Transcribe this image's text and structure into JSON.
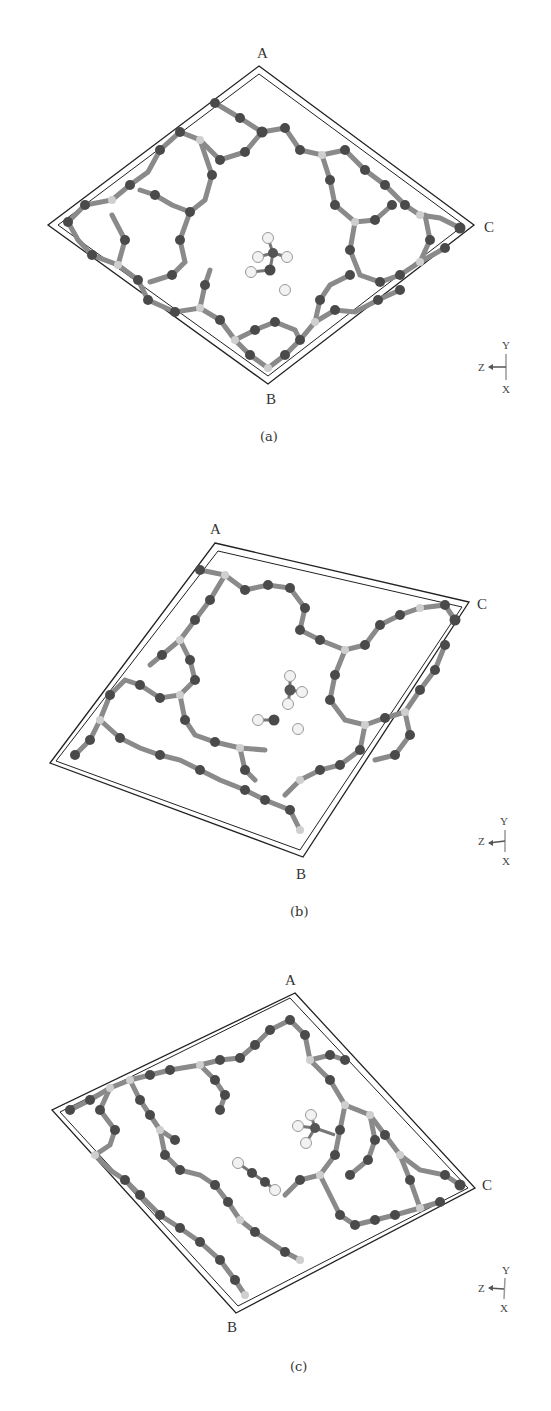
{
  "figure": {
    "panels": [
      {
        "id": "a",
        "caption": "(a)",
        "corner_labels": {
          "top": "A",
          "right": "C",
          "bottom": "B"
        },
        "axis_triad": {
          "up": "Y",
          "left": "Z",
          "down": "X"
        },
        "description": "Zeolite framework unit cell viewed along axis with adsorbed molecule (tetrahedral CH3 group + OH) in central pore"
      },
      {
        "id": "b",
        "caption": "(b)",
        "corner_labels": {
          "top": "A",
          "right": "C",
          "bottom": "B"
        },
        "axis_triad": {
          "up": "Y",
          "left": "Z",
          "down": "X"
        },
        "description": "Rotated framework view with separated methyl fragment and hydroxyl in central pore"
      },
      {
        "id": "c",
        "caption": "(c)",
        "corner_labels": {
          "top": "A",
          "right": "C",
          "bottom": "B"
        },
        "axis_triad": {
          "up": "Y",
          "left": "Z",
          "down": "X"
        },
        "description": "Further rotated framework view with methyl group bound near framework and linear H-O-O-H-like fragment in pore"
      }
    ],
    "colors": {
      "framework_atom": "#4a4a4a",
      "framework_bond": "#8a8a8a",
      "tetrahedral_site": "#c8c8c8",
      "hydrogen": "#f2f2f2",
      "cell_edge": "#222222"
    }
  }
}
